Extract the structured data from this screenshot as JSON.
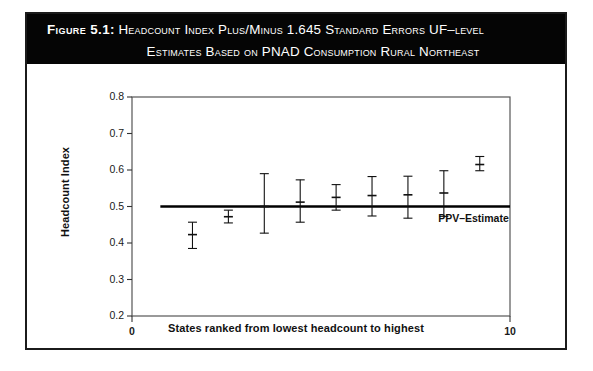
{
  "figure": {
    "label": "Figure 5.1:",
    "title_line_1": "Headcount Index Plus/Minus 1.645 Standard Errors UF–level",
    "title_line_2": "Estimates Based on PNAD Consumption Rural Northeast",
    "banner_color": "#050505",
    "banner_text_color": "#ffffff",
    "border_color": "#1b1b1b"
  },
  "chart_data": {
    "type": "scatter",
    "title": "Headcount Index Plus/Minus 1.645 Standard Errors UF–level Estimates Based on PNAD Consumption Rural Northeast",
    "xlabel": "States ranked from lowest headcount to highest",
    "ylabel": "Headcount Index",
    "xlim": [
      0,
      10
    ],
    "ylim": [
      0.2,
      0.8
    ],
    "grid": false,
    "legend": "none",
    "xticks": [
      0,
      10
    ],
    "xtick_labels": [
      "0",
      "10"
    ],
    "yticks": [
      0.2,
      0.3,
      0.4,
      0.5,
      0.6,
      0.7,
      0.8
    ],
    "ytick_labels": [
      "0.2",
      "0.3",
      "0.4",
      "0.5",
      "0.6",
      "0.7",
      "0.8"
    ],
    "error_bar_multiplier": 1.645,
    "reference_line": {
      "name": "PPV–Estimate",
      "label": "PPV–Estimate",
      "y": 0.5,
      "x_start": 0.75,
      "x_end": 10.0,
      "color": "#000000"
    },
    "x": [
      1.6,
      2.55,
      3.5,
      4.45,
      5.4,
      6.35,
      7.3,
      8.25,
      9.2
    ],
    "values": [
      0.423,
      0.472,
      0.5,
      0.512,
      0.525,
      0.53,
      0.532,
      0.537,
      0.615
    ],
    "err_low": [
      0.385,
      0.455,
      0.427,
      0.457,
      0.49,
      0.474,
      0.468,
      0.473,
      0.598
    ],
    "err_high": [
      0.457,
      0.49,
      0.59,
      0.573,
      0.56,
      0.582,
      0.583,
      0.598,
      0.637
    ]
  }
}
